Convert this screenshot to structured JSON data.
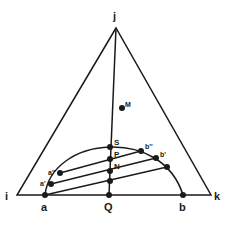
{
  "diagram": {
    "type": "ternary-phase-diagram",
    "vertices": {
      "top": {
        "label": "j",
        "x": 116,
        "y": 28
      },
      "left": {
        "label": "i",
        "x": 17,
        "y": 195
      },
      "right": {
        "label": "k",
        "x": 211,
        "y": 195
      }
    },
    "points": {
      "M": {
        "label": "M",
        "x": 122,
        "y": 108
      },
      "S": {
        "label": "S",
        "x": 110,
        "y": 147
      },
      "P": {
        "label": "P",
        "x": 110,
        "y": 159
      },
      "N": {
        "label": "N",
        "x": 110,
        "y": 171
      },
      "Q": {
        "label": "Q",
        "x": 109,
        "y": 195
      },
      "a": {
        "label": "a",
        "x": 45,
        "y": 195
      },
      "a1": {
        "label": "a'",
        "x": 51,
        "y": 184
      },
      "a2": {
        "label": "a''",
        "x": 60,
        "y": 173
      },
      "b": {
        "label": "b",
        "x": 183,
        "y": 195
      },
      "b1": {
        "label": "b'",
        "x": 156,
        "y": 158
      },
      "b2": {
        "label": "b''",
        "x": 141,
        "y": 151
      },
      "b3": {
        "label": "",
        "x": 167,
        "y": 167
      },
      "lower": {
        "label": "",
        "x": 110,
        "y": 181
      }
    },
    "tie_lines": [
      {
        "from": "a2",
        "to": "b2"
      },
      {
        "from": "a1",
        "to": "b1"
      },
      {
        "from": "a",
        "to": "b3"
      }
    ]
  }
}
